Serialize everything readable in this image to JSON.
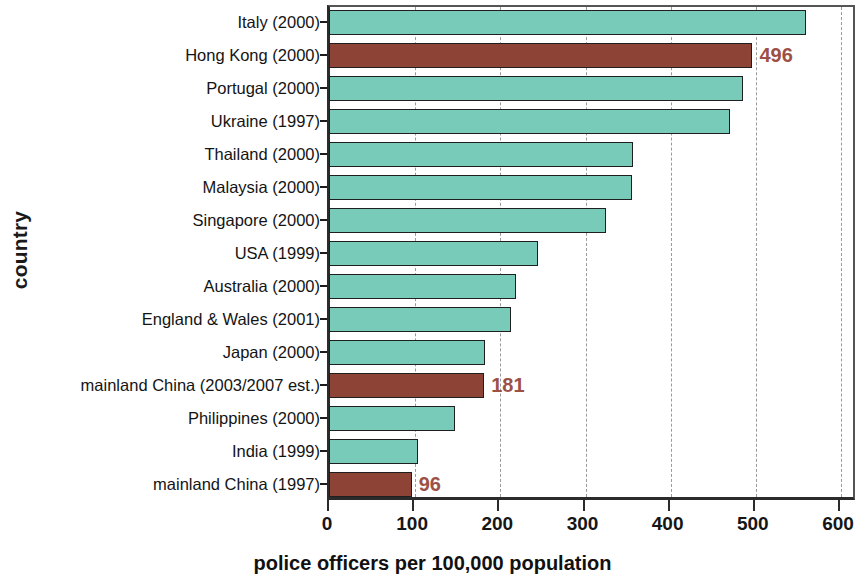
{
  "chart_data": {
    "type": "bar",
    "orientation": "horizontal",
    "title": "",
    "xlabel": "police officers per 100,000 population",
    "ylabel": "country",
    "xlim": [
      0,
      600
    ],
    "xticks": [
      0,
      100,
      200,
      300,
      400,
      500,
      600
    ],
    "xtick_labels": [
      "0",
      "100",
      "200",
      "300",
      "400",
      "500",
      "600"
    ],
    "grid": "vertical-dashed",
    "legend": "none",
    "categories": [
      "Italy (2000)",
      "Hong Kong (2000)",
      "Portugal (2000)",
      "Ukraine (1997)",
      "Thailand (2000)",
      "Malaysia (2000)",
      "Singapore (2000)",
      "USA (1999)",
      "Australia (2000)",
      "England & Wales (2001)",
      "Japan (2000)",
      "mainland China (2003/2007 est.)",
      "Philippines (2000)",
      "India (1999)",
      "mainland China (1997)"
    ],
    "values": [
      559,
      496,
      485,
      470,
      356,
      355,
      324,
      244,
      218,
      212,
      182,
      181,
      147,
      103,
      96
    ],
    "highlight_color": "#8d4336",
    "bar_color": "#78cbb8",
    "bar_edge_color": "#1f1f1f",
    "value_label_color": "#9d5046",
    "bars": [
      {
        "label": "Italy (2000)",
        "value": 559,
        "highlight": false,
        "annotation": ""
      },
      {
        "label": "Hong Kong (2000)",
        "value": 496,
        "highlight": true,
        "annotation": "496"
      },
      {
        "label": "Portugal (2000)",
        "value": 485,
        "highlight": false,
        "annotation": ""
      },
      {
        "label": "Ukraine (1997)",
        "value": 470,
        "highlight": false,
        "annotation": ""
      },
      {
        "label": "Thailand (2000)",
        "value": 356,
        "highlight": false,
        "annotation": ""
      },
      {
        "label": "Malaysia (2000)",
        "value": 355,
        "highlight": false,
        "annotation": ""
      },
      {
        "label": "Singapore (2000)",
        "value": 324,
        "highlight": false,
        "annotation": ""
      },
      {
        "label": "USA (1999)",
        "value": 244,
        "highlight": false,
        "annotation": ""
      },
      {
        "label": "Australia (2000)",
        "value": 218,
        "highlight": false,
        "annotation": ""
      },
      {
        "label": "England & Wales (2001)",
        "value": 212,
        "highlight": false,
        "annotation": ""
      },
      {
        "label": "Japan (2000)",
        "value": 182,
        "highlight": false,
        "annotation": ""
      },
      {
        "label": "mainland China (2003/2007 est.)",
        "value": 181,
        "highlight": true,
        "annotation": "181"
      },
      {
        "label": "Philippines (2000)",
        "value": 147,
        "highlight": false,
        "annotation": ""
      },
      {
        "label": "India (1999)",
        "value": 103,
        "highlight": false,
        "annotation": ""
      },
      {
        "label": "mainland China (1997)",
        "value": 96,
        "highlight": true,
        "annotation": "96"
      }
    ]
  }
}
